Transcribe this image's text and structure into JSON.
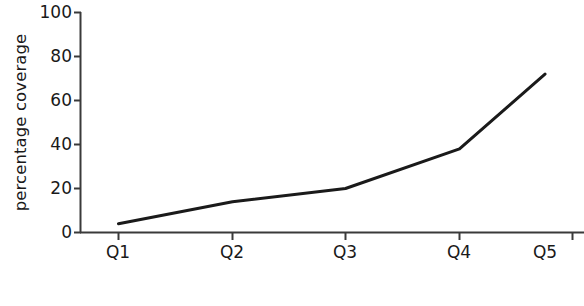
{
  "chart_data": {
    "type": "line",
    "title": "",
    "xlabel": "budget quintile",
    "ylabel": "percentage coverage",
    "categories": [
      "Q1",
      "Q2",
      "Q3",
      "Q4",
      "Q5"
    ],
    "values": [
      4,
      14,
      20,
      38,
      72
    ],
    "series": [
      {
        "name": "percentage coverage",
        "values": [
          4,
          14,
          20,
          38,
          72
        ]
      }
    ],
    "ylim": [
      0,
      100
    ],
    "yticks": [
      0,
      20,
      40,
      60,
      80,
      100
    ],
    "ytick_labels": [
      "0",
      "20",
      "40",
      "60",
      "80",
      "100"
    ],
    "xtick_labels": [
      "Q1",
      "Q2",
      "Q3",
      "Q4",
      "Q5"
    ],
    "grid": false,
    "legend": false,
    "legend_position": "none",
    "line_color": "#1a1a1a",
    "background_color": "#ffffff",
    "markers": false
  },
  "axes": {
    "y_title": "percentage coverage",
    "x_title": "budget quintile"
  }
}
